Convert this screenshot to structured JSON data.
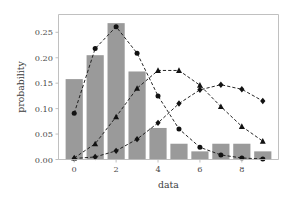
{
  "chart_data": {
    "type": "bar",
    "title": "",
    "xlabel": "data",
    "ylabel": "probability",
    "categories": [
      0,
      1,
      2,
      3,
      4,
      5,
      6,
      7,
      8,
      9
    ],
    "values": [
      0.158,
      0.205,
      0.268,
      0.173,
      0.062,
      0.031,
      0.016,
      0.031,
      0.031,
      0.016
    ],
    "xlim": [
      -0.75,
      9.75
    ],
    "ylim": [
      0.0,
      0.285
    ],
    "xticks": [
      0,
      2,
      4,
      6,
      8
    ],
    "xtick_labels": [
      "0",
      "2",
      "4",
      "6",
      "8"
    ],
    "yticks": [
      0.0,
      0.05,
      0.1,
      0.15,
      0.2,
      0.25
    ],
    "ytick_labels": [
      "0.00",
      "0.05",
      "0.10",
      "0.15",
      "0.20",
      "0.25"
    ],
    "grid": false,
    "legend": "none",
    "bar_color": "#9a9a9a",
    "line_color": "#121212",
    "series": [
      {
        "name": "circle-series",
        "marker": "circle",
        "linestyle": "dashed",
        "x": [
          0,
          1,
          2,
          3,
          4,
          5,
          6,
          7,
          8,
          9
        ],
        "values": [
          0.091,
          0.218,
          0.261,
          0.209,
          0.125,
          0.06,
          0.024,
          0.009,
          0.003,
          0.001
        ]
      },
      {
        "name": "triangle-series",
        "marker": "triangle",
        "linestyle": "dashed",
        "x": [
          0,
          1,
          2,
          3,
          4,
          5,
          6,
          7,
          8,
          9
        ],
        "values": [
          0.003,
          0.031,
          0.084,
          0.14,
          0.175,
          0.175,
          0.146,
          0.104,
          0.065,
          0.036
        ]
      },
      {
        "name": "diamond-series",
        "marker": "diamond",
        "linestyle": "dashed",
        "x": [
          0,
          1,
          2,
          3,
          4,
          5,
          6,
          7,
          8,
          9
        ],
        "values": [
          0.002,
          0.005,
          0.017,
          0.04,
          0.072,
          0.11,
          0.137,
          0.147,
          0.138,
          0.115
        ]
      }
    ]
  }
}
